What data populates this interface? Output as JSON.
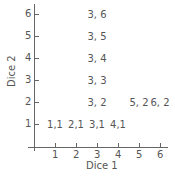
{
  "chart_data": {
    "type": "scatter",
    "title": "",
    "xlabel": "Dice 1",
    "ylabel": "Dice 2",
    "xlim": [
      0,
      6
    ],
    "ylim": [
      0,
      6
    ],
    "x_ticks": [
      "1",
      "2",
      "3",
      "4",
      "5",
      "6"
    ],
    "y_ticks": [
      "1",
      "2",
      "3",
      "4",
      "5",
      "6"
    ],
    "grid": false,
    "legend": null,
    "points": [
      {
        "x": 1,
        "y": 1,
        "label": "1,1"
      },
      {
        "x": 2,
        "y": 1,
        "label": "2,1"
      },
      {
        "x": 3,
        "y": 1,
        "label": "3,1"
      },
      {
        "x": 4,
        "y": 1,
        "label": "4,1"
      },
      {
        "x": 3,
        "y": 2,
        "label": "3, 2"
      },
      {
        "x": 5,
        "y": 2,
        "label": "5, 2"
      },
      {
        "x": 6,
        "y": 2,
        "label": "6, 2"
      },
      {
        "x": 3,
        "y": 3,
        "label": "3, 3"
      },
      {
        "x": 3,
        "y": 4,
        "label": "3, 4"
      },
      {
        "x": 3,
        "y": 5,
        "label": "3, 5"
      },
      {
        "x": 3,
        "y": 6,
        "label": "3, 6"
      }
    ]
  }
}
